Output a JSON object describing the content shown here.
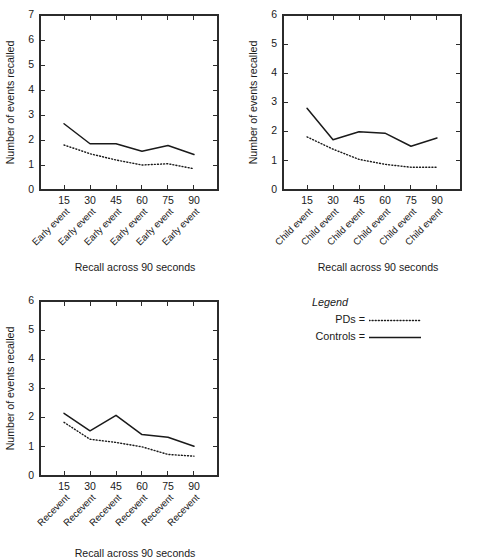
{
  "figure": {
    "background": "#ffffff",
    "ink_color": "#1a1a1a"
  },
  "legend": {
    "title": "Legend",
    "entries": [
      {
        "label": "PDs =",
        "style": "dotted",
        "series": "PDs"
      },
      {
        "label": "Controls =",
        "style": "solid",
        "series": "Controls"
      }
    ]
  },
  "chart_data": [
    {
      "id": "early-event",
      "type": "line",
      "title": "",
      "xlabel": "Recall across 90 seconds",
      "ylabel": "Number of events recalled",
      "x": [
        15,
        30,
        45,
        60,
        75,
        90
      ],
      "xtick_labels": [
        "15",
        "30",
        "45",
        "60",
        "75",
        "90"
      ],
      "categories": [
        "Early event",
        "Early event",
        "Early event",
        "Early event",
        "Early event",
        "Early event"
      ],
      "ylim": [
        0,
        7
      ],
      "yticks": [
        0,
        1,
        2,
        3,
        4,
        5,
        6,
        7
      ],
      "ytick_labels": [
        "0",
        "1",
        "2",
        "3",
        "4",
        "5",
        "6",
        "7"
      ],
      "grid": false,
      "legend_position": "external",
      "series": [
        {
          "name": "Controls",
          "style": "solid",
          "values": [
            2.65,
            1.85,
            1.85,
            1.55,
            1.78,
            1.42
          ]
        },
        {
          "name": "PDs",
          "style": "dotted",
          "values": [
            1.8,
            1.45,
            1.2,
            1.0,
            1.05,
            0.85
          ]
        }
      ]
    },
    {
      "id": "child-event",
      "type": "line",
      "title": "",
      "xlabel": "Recall across 90 seconds",
      "ylabel": "Number of events recalled",
      "x": [
        15,
        30,
        45,
        60,
        75,
        90
      ],
      "xtick_labels": [
        "15",
        "30",
        "45",
        "60",
        "75",
        "90"
      ],
      "categories": [
        "Child event",
        "Child event",
        "Child event",
        "Child event",
        "Child event",
        "Child event"
      ],
      "ylim": [
        0,
        6
      ],
      "yticks": [
        0,
        1,
        2,
        3,
        4,
        5,
        6
      ],
      "ytick_labels": [
        "0",
        "1",
        "2",
        "3",
        "4",
        "5",
        "6"
      ],
      "grid": false,
      "legend_position": "external",
      "series": [
        {
          "name": "Controls",
          "style": "solid",
          "values": [
            2.8,
            1.72,
            2.0,
            1.95,
            1.5,
            1.78
          ]
        },
        {
          "name": "PDs",
          "style": "dotted",
          "values": [
            1.82,
            1.4,
            1.05,
            0.88,
            0.78,
            0.78
          ]
        }
      ]
    },
    {
      "id": "recevent",
      "type": "line",
      "title": "",
      "xlabel": "Recall across 90 seconds",
      "ylabel": "Number of events recalled",
      "x": [
        15,
        30,
        45,
        60,
        75,
        90
      ],
      "xtick_labels": [
        "15",
        "30",
        "45",
        "60",
        "75",
        "90"
      ],
      "categories": [
        "Recevent",
        "Recevent",
        "Recevent",
        "Recevent",
        "Recevent",
        "Recevent"
      ],
      "ylim": [
        0,
        6
      ],
      "yticks": [
        0,
        1,
        2,
        3,
        4,
        5,
        6
      ],
      "ytick_labels": [
        "0",
        "1",
        "2",
        "3",
        "4",
        "5",
        "6"
      ],
      "grid": false,
      "legend_position": "external",
      "series": [
        {
          "name": "Controls",
          "style": "solid",
          "values": [
            2.15,
            1.55,
            2.08,
            1.42,
            1.33,
            1.02
          ]
        },
        {
          "name": "PDs",
          "style": "dotted",
          "values": [
            1.84,
            1.26,
            1.15,
            1.0,
            0.74,
            0.68
          ]
        }
      ]
    }
  ],
  "panels": [
    {
      "chart": 0,
      "left": 0,
      "top": 0,
      "width": 246,
      "height": 280
    },
    {
      "chart": 1,
      "left": 243,
      "top": 0,
      "width": 250,
      "height": 280
    },
    {
      "chart": 2,
      "left": 0,
      "top": 286,
      "width": 246,
      "height": 274
    }
  ]
}
